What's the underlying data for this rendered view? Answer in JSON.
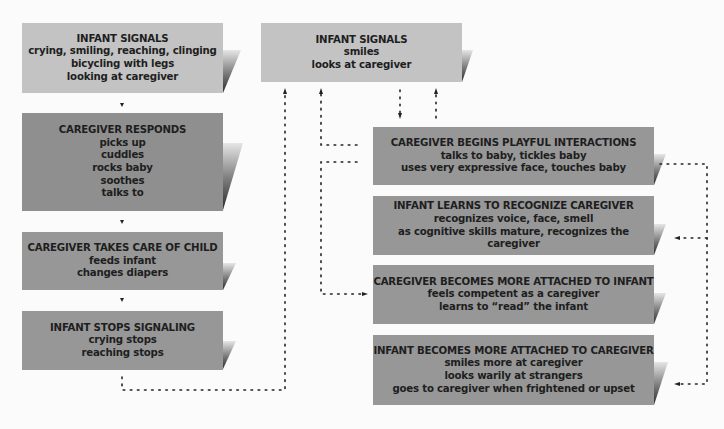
{
  "left_column": [
    {
      "id": "infant-signals-1",
      "title": "INFANT SIGNALS",
      "lines": [
        "crying, smiling, reaching, clinging",
        "bicycling with legs",
        "looking at caregiver"
      ],
      "shade": "#c3c3c3"
    },
    {
      "id": "caregiver-responds",
      "title": "CAREGIVER RESPONDS",
      "lines": [
        "picks up",
        "cuddles",
        "rocks baby",
        "soothes",
        "talks to"
      ],
      "shade": "#8d8d8d"
    },
    {
      "id": "caregiver-takes-care",
      "title": "CAREGIVER TAKES CARE OF CHILD",
      "lines": [
        "feeds infant",
        "changes diapers"
      ],
      "shade": "#979797"
    },
    {
      "id": "infant-stops-signaling",
      "title": "INFANT STOPS SIGNALING",
      "lines": [
        "crying stops",
        "reaching stops"
      ],
      "shade": "#979797"
    }
  ],
  "right_column": [
    {
      "id": "infant-signals-2",
      "title": "INFANT SIGNALS",
      "lines": [
        "smiles",
        "looks at caregiver"
      ],
      "shade": "#c3c3c3"
    },
    {
      "id": "caregiver-playful",
      "title": "CAREGIVER BEGINS PLAYFUL INTERACTIONS",
      "lines": [
        "talks to baby, tickles baby",
        "uses very expressive face, touches baby"
      ],
      "shade": "#979797"
    },
    {
      "id": "infant-learns",
      "title": "INFANT LEARNS TO RECOGNIZE CAREGIVER",
      "lines": [
        "recognizes voice, face, smell",
        "as cognitive skills mature, recognizes the caregiver"
      ],
      "shade": "#979797"
    },
    {
      "id": "caregiver-attached",
      "title": "CAREGIVER BECOMES MORE ATTACHED TO INFANT",
      "lines": [
        "feels competent as a caregiver",
        "learns to “read” the infant"
      ],
      "shade": "#979797"
    },
    {
      "id": "infant-attached",
      "title": "INFANT BECOMES MORE ATTACHED TO CAREGIVER",
      "lines": [
        "smiles more at caregiver",
        "looks warily at strangers",
        "goes to caregiver when frightened or upset"
      ],
      "shade": "#979797"
    }
  ],
  "connectors": [
    {
      "from": "infant-signals-1",
      "to": "caregiver-responds",
      "style": "solid-arrow"
    },
    {
      "from": "caregiver-responds",
      "to": "caregiver-takes-care",
      "style": "solid-arrow"
    },
    {
      "from": "caregiver-takes-care",
      "to": "infant-stops-signaling",
      "style": "solid-arrow"
    },
    {
      "from": "infant-stops-signaling",
      "to": "infant-signals-2",
      "style": "dotted-arrow"
    },
    {
      "from": "infant-signals-2",
      "to": "caregiver-playful",
      "style": "dotted-arrow"
    },
    {
      "from": "caregiver-playful",
      "to": "infant-signals-2",
      "style": "dotted-arrow"
    },
    {
      "from": "caregiver-playful",
      "to": "infant-signals-2",
      "style": "dotted-arrow-left"
    },
    {
      "from": "caregiver-playful",
      "to": "caregiver-attached",
      "style": "dotted-arrow-left"
    },
    {
      "from": "caregiver-playful",
      "to": "infant-learns",
      "style": "dotted-arrow-right"
    },
    {
      "from": "caregiver-playful",
      "to": "infant-attached",
      "style": "dotted-arrow-right"
    }
  ]
}
